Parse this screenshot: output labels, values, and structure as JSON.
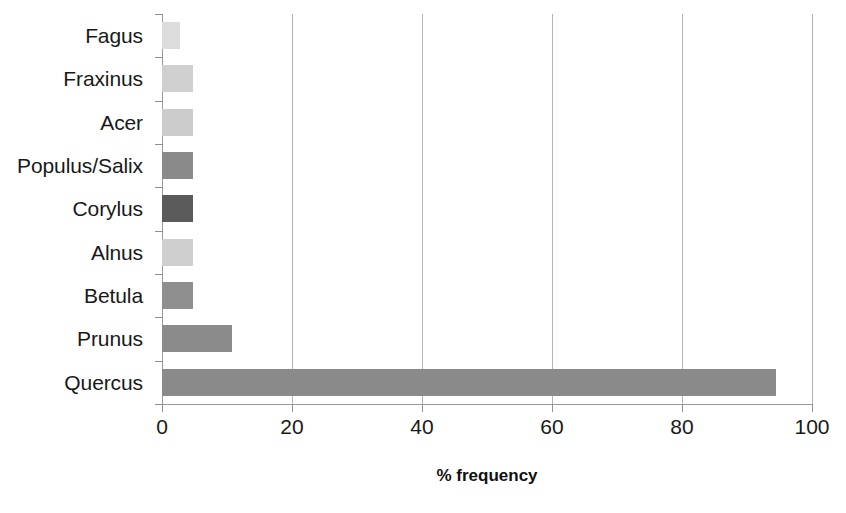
{
  "chart_data": {
    "type": "bar",
    "orientation": "horizontal",
    "title": "",
    "xlabel": "% frequency",
    "ylabel": "",
    "xlim": [
      0,
      100
    ],
    "xticks": [
      0,
      20,
      40,
      60,
      80,
      100
    ],
    "xticklabels": [
      "0",
      "20",
      "40",
      "60",
      "80",
      "100"
    ],
    "grid": "vertical",
    "legend": "none",
    "categories": [
      "Fagus",
      "Fraxinus",
      "Acer",
      "Populus/Salix",
      "Corylus",
      "Alnus",
      "Betula",
      "Prunus",
      "Quercus"
    ],
    "values": [
      2.8,
      4.8,
      4.8,
      4.8,
      4.8,
      4.8,
      4.8,
      10.8,
      94.5
    ],
    "bar_colors": [
      "#dcdcdc",
      "#d0d0d0",
      "#cccccc",
      "#8a8a8a",
      "#5a5a5a",
      "#cfcfcf",
      "#8f8f8f",
      "#8b8b8b",
      "#8a8a8a"
    ],
    "bars": [
      {
        "category": "Fagus",
        "value": 2.8,
        "color": "#dcdcdc"
      },
      {
        "category": "Fraxinus",
        "value": 4.8,
        "color": "#d0d0d0"
      },
      {
        "category": "Acer",
        "value": 4.8,
        "color": "#cccccc"
      },
      {
        "category": "Populus/Salix",
        "value": 4.8,
        "color": "#8a8a8a"
      },
      {
        "category": "Corylus",
        "value": 4.8,
        "color": "#5a5a5a"
      },
      {
        "category": "Alnus",
        "value": 4.8,
        "color": "#cfcfcf"
      },
      {
        "category": "Betula",
        "value": 4.8,
        "color": "#8f8f8f"
      },
      {
        "category": "Prunus",
        "value": 10.8,
        "color": "#8b8b8b"
      },
      {
        "category": "Quercus",
        "value": 94.5,
        "color": "#8a8a8a"
      }
    ],
    "axis_color": "#9a9a9a",
    "gridline_color": "#b4b4b4"
  },
  "footer": {
    "clipped_caption": ""
  }
}
